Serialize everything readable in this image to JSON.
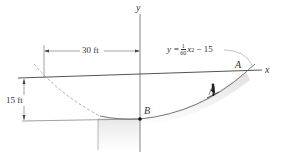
{
  "diagram": {
    "type": "engineering-mechanics-figure",
    "axes": {
      "x_label": "x",
      "y_label": "y"
    },
    "points": {
      "A": "A",
      "B": "B"
    },
    "dimensions": {
      "horizontal": "30 ft",
      "vertical": "15 ft"
    },
    "equation": {
      "lhs": "y =",
      "frac_num": "1",
      "frac_den": "60",
      "var": "x",
      "exp": "2",
      "rhs": "− 15"
    },
    "objects": [
      "parabolic-track",
      "skier"
    ],
    "colors": {
      "line": "#555555",
      "dashed": "#9a9a9a",
      "shade": "#e6e6e6",
      "point": "#111111"
    }
  }
}
